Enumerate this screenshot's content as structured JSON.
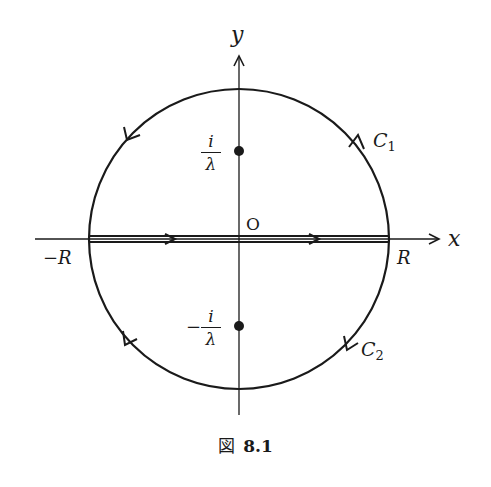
{
  "diagram": {
    "axes": {
      "x_label": "x",
      "y_label": "y",
      "origin_label": "O"
    },
    "points": {
      "upper": {
        "numerator": "i",
        "denominator": "λ",
        "sign": ""
      },
      "lower": {
        "numerator": "i",
        "denominator": "λ",
        "sign": "−"
      }
    },
    "real_axis_labels": {
      "left": "−R",
      "right": "R"
    },
    "contours": {
      "upper": {
        "name": "C",
        "subscript": "1"
      },
      "lower": {
        "name": "C",
        "subscript": "2"
      }
    },
    "colors": {
      "stroke": "#1a1a1a",
      "background": "#ffffff"
    }
  },
  "caption": {
    "prefix": "図",
    "number": "8.1"
  }
}
